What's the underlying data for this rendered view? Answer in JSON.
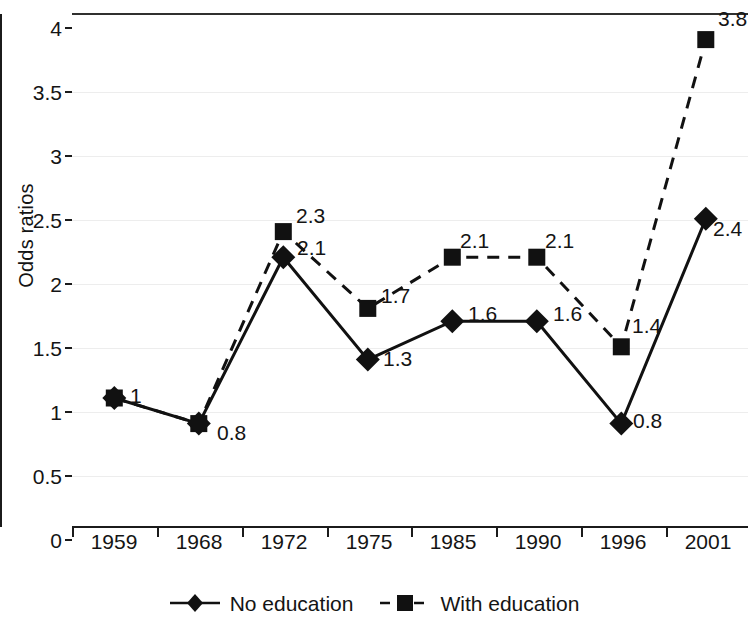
{
  "chart_data": {
    "type": "line",
    "title": "",
    "xlabel": "",
    "ylabel": "Odds ratios",
    "categories": [
      "1959",
      "1968",
      "1972",
      "1975",
      "1985",
      "1990",
      "1996",
      "2001"
    ],
    "ylim": [
      0,
      4
    ],
    "ytick_labels": [
      "0",
      "0.5",
      "1",
      "1.5",
      "2",
      "2.5",
      "3",
      "3.5",
      "4"
    ],
    "ytick_values": [
      0,
      0.5,
      1,
      1.5,
      2,
      2.5,
      3,
      3.5,
      4
    ],
    "grid": true,
    "legend_position": "bottom",
    "series": [
      {
        "name": "No education",
        "marker": "diamond",
        "linestyle": "solid",
        "color": "#111111",
        "values": [
          1,
          0.8,
          2.1,
          1.3,
          1.6,
          1.6,
          0.8,
          2.4
        ],
        "labels": [
          "1",
          "0.8",
          "2.1",
          "1.3",
          "1.6",
          "1.6",
          "0.8",
          "2.4"
        ]
      },
      {
        "name": "With education",
        "marker": "square",
        "linestyle": "dashed",
        "color": "#111111",
        "values": [
          1,
          0.8,
          2.3,
          1.7,
          2.1,
          2.1,
          1.4,
          3.8
        ],
        "labels": [
          "",
          "",
          "2.3",
          "1.7",
          "2.1",
          "2.1",
          "1.4",
          "3.8"
        ]
      }
    ],
    "annotations": [
      {
        "text": "1",
        "series": "No education",
        "category": "1959"
      },
      {
        "text": "0.8",
        "series": "No education",
        "category": "1968"
      },
      {
        "text": "2.3",
        "series": "With education",
        "category": "1972"
      },
      {
        "text": "2.1",
        "series": "No education",
        "category": "1972"
      },
      {
        "text": "1.7",
        "series": "With education",
        "category": "1975"
      },
      {
        "text": "1.3",
        "series": "No education",
        "category": "1975"
      },
      {
        "text": "2.1",
        "series": "With education",
        "category": "1985"
      },
      {
        "text": "1.6",
        "series": "No education",
        "category": "1985"
      },
      {
        "text": "2.1",
        "series": "With education",
        "category": "1990"
      },
      {
        "text": "1.6",
        "series": "No education",
        "category": "1990"
      },
      {
        "text": "1.4",
        "series": "With education",
        "category": "1996"
      },
      {
        "text": "0.8",
        "series": "No education",
        "category": "1996"
      },
      {
        "text": "3.8",
        "series": "With education",
        "category": "2001"
      },
      {
        "text": "2.4",
        "series": "No education",
        "category": "2001"
      }
    ]
  },
  "axis": {
    "y_title": "Odds ratios",
    "y_ticks": [
      "4",
      "3.5",
      "3",
      "2.5",
      "2",
      "1.5",
      "1",
      "0.5",
      "0"
    ],
    "x_ticks": [
      "1959",
      "1968",
      "1972",
      "1975",
      "1985",
      "1990",
      "1996",
      "2001"
    ]
  },
  "legend": {
    "entries": [
      {
        "label": "No education",
        "marker": "diamond-marker-icon",
        "line": "solid"
      },
      {
        "label": "With education",
        "marker": "square-marker-icon",
        "line": "dashed"
      }
    ]
  },
  "point_labels": {
    "no_education": {
      "y1959": "1",
      "y1968": "0.8",
      "y1972": "2.1",
      "y1975": "1.3",
      "y1985": "1.6",
      "y1990": "1.6",
      "y1996": "0.8",
      "y2001": "2.4"
    },
    "with_education": {
      "y1972": "2.3",
      "y1975": "1.7",
      "y1985": "2.1",
      "y1990": "2.1",
      "y1996": "1.4",
      "y2001": "3.8"
    }
  }
}
